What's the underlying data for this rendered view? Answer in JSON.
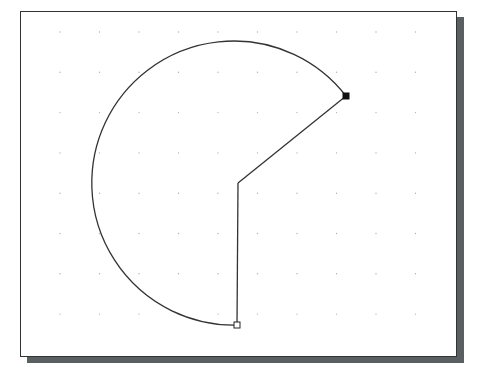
{
  "drawing": {
    "type": "arc-sector",
    "description": "Arc drawn counterclockwise from start point around left side to end point, closed by two radial lines to center",
    "grid": {
      "visible": true,
      "style": "dots"
    },
    "colors": {
      "stroke": "#333333",
      "background": "#ffffff",
      "shadow": "#5a5f61",
      "grid": "#b0b0b0"
    },
    "markers": [
      {
        "name": "start-point",
        "style": "hollow-square"
      },
      {
        "name": "end-point",
        "style": "filled-square"
      }
    ]
  }
}
